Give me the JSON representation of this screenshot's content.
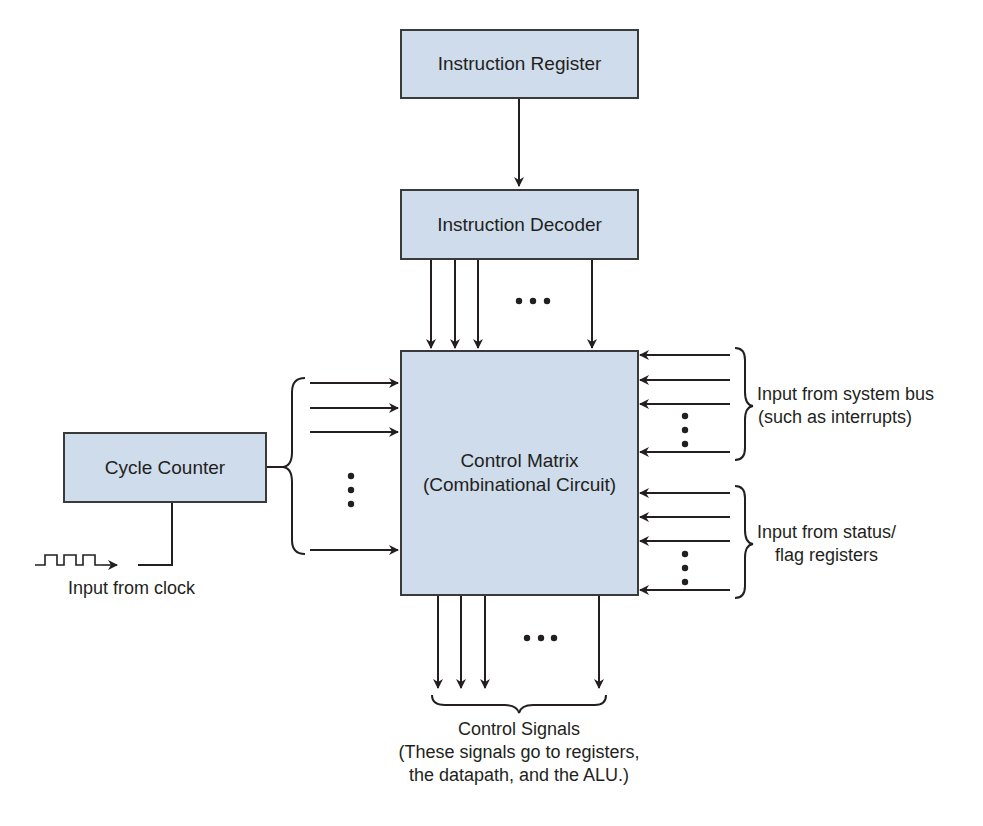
{
  "blocks": {
    "instruction_register": "Instruction Register",
    "instruction_decoder": "Instruction Decoder",
    "cycle_counter": "Cycle Counter",
    "control_matrix_line1": "Control Matrix",
    "control_matrix_line2": "(Combinational Circuit)"
  },
  "labels": {
    "clock_input": "Input from clock",
    "system_bus_line1": "Input from system bus",
    "system_bus_line2": "(such as interrupts)",
    "status_flags_line1": "Input from status/",
    "status_flags_line2": "flag registers",
    "control_signals_title": "Control Signals",
    "control_signals_line2": "(These signals go to registers,",
    "control_signals_line3": "the datapath, and the ALU.)"
  },
  "colors": {
    "block_fill": "#cfdcec",
    "line": "#231f20"
  }
}
